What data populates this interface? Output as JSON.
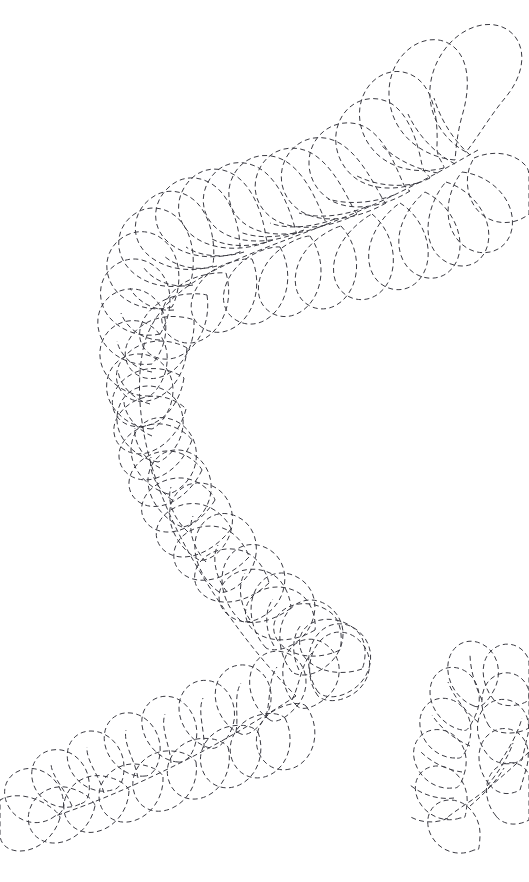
{
  "document": {
    "title": "Feather Plume Quilting Stencil",
    "description": "Dashed-line feather / plume motif stencil pattern",
    "width": 529,
    "height": 882,
    "background_color": "#ffffff",
    "stroke_color": "#3a3a42",
    "stroke_width": 1,
    "dash_length": 5,
    "gap_length": 3.4,
    "text_content": "",
    "visible_labels": []
  },
  "artwork": {
    "style": "dashed outline line-art",
    "motif": "feather plume scroll",
    "elements": [
      {
        "name": "main-feather-crescent",
        "shape": "C-shaped crescent",
        "tip": [
          430,
          22
        ],
        "tail_point": [
          55,
          816
        ],
        "plume_count": 38
      },
      {
        "name": "secondary-feather-fragment",
        "shape": "partial plume cluster",
        "anchor": [
          520,
          812
        ],
        "plume_count": 11,
        "cropped_edge": "right"
      }
    ],
    "spines": [
      {
        "name": "main-spine",
        "path": "M 440 140 C 400 175 350 205 300 225 C 250 246 205 268 176 300 C 145 335 135 385 142 432 C 150 488 176 540 212 596 C 250 654 288 700 305 700"
      },
      {
        "name": "tail-spine",
        "path": "M 305 700 C 280 714 235 742 190 768 C 145 792 95 808 55 816"
      },
      {
        "name": "fragment-spine",
        "path": "M 529 770 C 505 784 480 800 462 812"
      }
    ],
    "colors": {
      "background": "#ffffff",
      "line": "#3a3a42"
    }
  }
}
